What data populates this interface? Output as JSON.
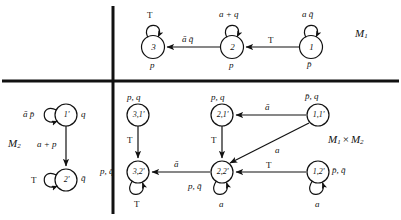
{
  "figure": {
    "type": "state-transition-diagrams",
    "quadrants": {
      "top_right": "M1",
      "bottom_left": "M2",
      "bottom_right": "M1 x M2"
    }
  },
  "titles": {
    "m1": "M",
    "m1_sub": "1",
    "m2": "M",
    "m2_sub": "2",
    "product_left": "M",
    "product_left_sub": "1",
    "product_times": "×",
    "product_right": "M",
    "product_right_sub": "2"
  },
  "m1": {
    "name": "M1",
    "states": [
      {
        "id": "3",
        "label": "3",
        "output": "p",
        "self_loop": "T"
      },
      {
        "id": "2",
        "label": "2",
        "output": "p",
        "self_loop": "a + q"
      },
      {
        "id": "1",
        "label": "1",
        "output": "p̄",
        "self_loop": "a q̄"
      }
    ],
    "transitions": [
      {
        "from": "2",
        "to": "3",
        "label": "ā q̄"
      },
      {
        "from": "1",
        "to": "2",
        "label": "T"
      }
    ]
  },
  "m2": {
    "name": "M2",
    "states": [
      {
        "id": "1p",
        "label": "1'",
        "output": "q",
        "self_loop": "ā p̄"
      },
      {
        "id": "2p",
        "label": "2'",
        "output": "q̄",
        "self_loop": "T"
      }
    ],
    "transitions": [
      {
        "from": "1p",
        "to": "2p",
        "label": "a + p"
      }
    ]
  },
  "product": {
    "name": "M1 x M2",
    "states": [
      {
        "id": "31p",
        "label": "3,1'",
        "output": "p, q",
        "self_loop": null
      },
      {
        "id": "21p",
        "label": "2,1'",
        "output": "p, q",
        "self_loop": null
      },
      {
        "id": "11p",
        "label": "1,1'",
        "output": "p̄, q",
        "self_loop": null
      },
      {
        "id": "32p",
        "label": "3,2'",
        "output": "p, q̄",
        "self_loop": "T"
      },
      {
        "id": "22p",
        "label": "2,2'",
        "output": "p, q̄",
        "self_loop": "a"
      },
      {
        "id": "12p",
        "label": "1,2'",
        "output": "p̄, q̄",
        "self_loop": "a"
      }
    ],
    "transitions": [
      {
        "from": "11p",
        "to": "21p",
        "label": "ā"
      },
      {
        "from": "11p",
        "to": "22p",
        "label": "a"
      },
      {
        "from": "31p",
        "to": "32p",
        "label": "T"
      },
      {
        "from": "21p",
        "to": "22p",
        "label": "T"
      },
      {
        "from": "22p",
        "to": "32p",
        "label": "ā"
      },
      {
        "from": "12p",
        "to": "22p",
        "label": "T"
      }
    ]
  },
  "colors": {
    "ink": "#111111",
    "background": "#ffffff"
  }
}
